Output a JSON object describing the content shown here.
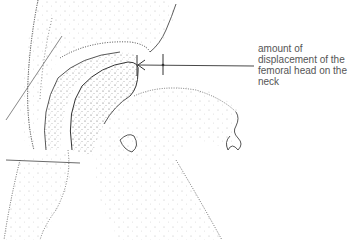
{
  "figure": {
    "style": "stippled line drawing",
    "ink_color": "#3a3a3a",
    "background": "#ffffff"
  },
  "annotation": {
    "lines": [
      "amount of",
      "displacement of the",
      "femoral head on the",
      "neck"
    ],
    "pointer": "arrow-with-measure-bar"
  }
}
